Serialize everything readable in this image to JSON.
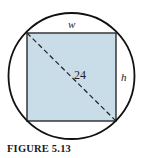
{
  "diagram": {
    "caption": "FIGURE 5.13",
    "labels": {
      "width": "w",
      "height": "h",
      "diagonal": "24"
    },
    "colors": {
      "rect_fill": "#c9dde9",
      "stroke": "#111111",
      "background": "#ffffff"
    }
  }
}
